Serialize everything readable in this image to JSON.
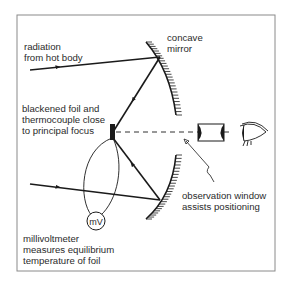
{
  "diagram": {
    "labels": {
      "radiation_line1": "radiation",
      "radiation_line2": "from hot body",
      "mirror_line1": "concave",
      "mirror_line2": "mirror",
      "foil_line1": "blackened foil and",
      "foil_line2": "thermocouple close",
      "foil_line3": "to principal focus",
      "window_line1": "observation window",
      "window_line2": "assists positioning",
      "meter_symbol": "mV",
      "meter_line1": "millivoltmeter",
      "meter_line2": "measures equilibrium",
      "meter_line3": "temperature of foil"
    },
    "colors": {
      "ink": "#1a1a1a",
      "frame": "#8a8a8a",
      "background": "#ffffff"
    }
  }
}
